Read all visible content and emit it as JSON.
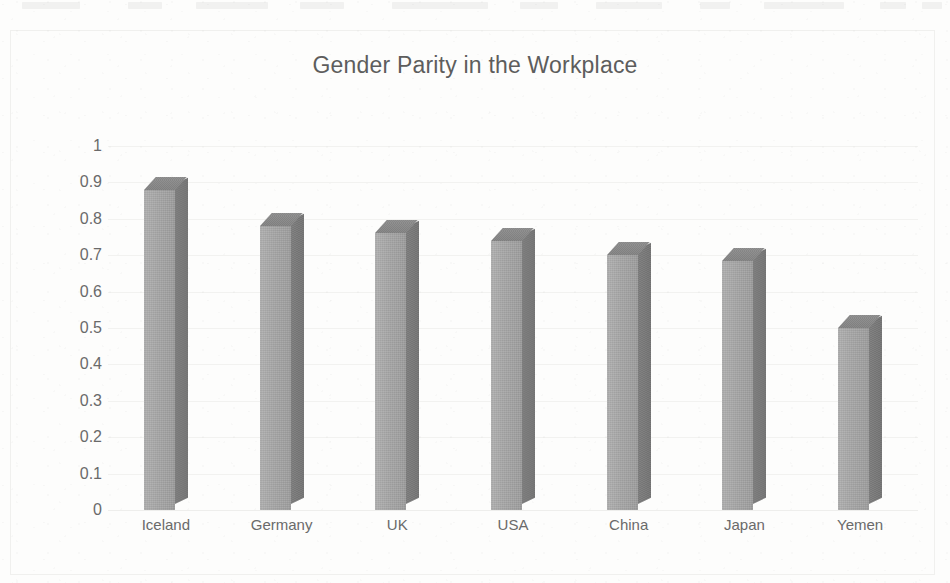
{
  "document": {
    "background_color": "#fdfdfc",
    "frame_color": "#f0f0ee"
  },
  "chart_data": {
    "type": "bar",
    "title": "Gender Parity in the Workplace",
    "subtitle": "",
    "xlabel": "",
    "ylabel": "",
    "categories": [
      "Iceland",
      "Germany",
      "UK",
      "USA",
      "China",
      "Japan",
      "Yemen"
    ],
    "values": [
      0.88,
      0.78,
      0.76,
      0.74,
      0.7,
      0.685,
      0.5
    ],
    "ylim": [
      0,
      1
    ],
    "ytick_step": 0.1,
    "ytick_labels": [
      "1",
      "0.9",
      "0.8",
      "0.7",
      "0.6",
      "0.5",
      "0.4",
      "0.3",
      "0.2",
      "0.1",
      "0"
    ],
    "ytick_values": [
      1,
      0.9,
      0.8,
      0.7,
      0.6,
      0.5,
      0.4,
      0.3,
      0.2,
      0.1,
      0
    ],
    "grid": true,
    "grid_axis": "y",
    "legend": false,
    "legend_position": "none",
    "series": [
      {
        "name": "Gender Parity Index",
        "values": [
          0.88,
          0.78,
          0.76,
          0.74,
          0.7,
          0.685,
          0.5
        ]
      }
    ],
    "style": {
      "bar_style": "3d-column",
      "bar_front_color": "#a6a6a6",
      "bar_side_color": "#7a7a7a",
      "bar_top_color": "#878787",
      "gridline_color": "#f2f2f0",
      "title_color": "#5d5d5d",
      "tick_label_color": "#6a6a6a"
    }
  },
  "top_artifacts": [
    {
      "left": 22,
      "width": 58
    },
    {
      "left": 128,
      "width": 34
    },
    {
      "left": 196,
      "width": 72
    },
    {
      "left": 300,
      "width": 44
    },
    {
      "left": 392,
      "width": 96
    },
    {
      "left": 520,
      "width": 38
    },
    {
      "left": 596,
      "width": 66
    },
    {
      "left": 700,
      "width": 30
    },
    {
      "left": 764,
      "width": 80
    },
    {
      "left": 880,
      "width": 26
    },
    {
      "left": 922,
      "width": 20
    }
  ]
}
